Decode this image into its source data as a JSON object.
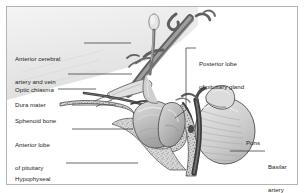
{
  "figure": {
    "border_color": "#b3b3b3",
    "background": "#ffffff",
    "text_color": "#231f20"
  },
  "labels": {
    "anterior_cerebral": {
      "line1": "Anterior cerebral",
      "line2": "artery and vein",
      "x": 15,
      "y": 40
    },
    "optic_chiasma": {
      "line1": "Optic chiasma",
      "x": 15,
      "y": 71
    },
    "dura_mater": {
      "line1": "Dura mater",
      "x": 15,
      "y": 86
    },
    "sphenoid_bone": {
      "line1": "Sphenoid bone",
      "x": 15,
      "y": 102
    },
    "anterior_lobe": {
      "line1": "Anterior lobe",
      "line2": "of pituitary",
      "x": 15,
      "y": 126
    },
    "hypophyseal_fossa": {
      "line1": "Hypophyseal",
      "line2": "fossa",
      "x": 15,
      "y": 160
    },
    "posterior_lobe": {
      "line1": "Posterior lobe",
      "line2": "of pituitary gland",
      "x": 199,
      "y": 45
    },
    "pons": {
      "line1": "Pons",
      "x": 246,
      "y": 124
    },
    "basilar_artery": {
      "line1": "Basilar",
      "line2": "artery",
      "x": 268,
      "y": 148
    }
  },
  "colors": {
    "outline": "#3a3a3a",
    "vessel_dark": "#6f6f6f",
    "vessel_mid": "#8e8e8e",
    "bone_stipple": "#8a8a8a",
    "bone_fill": "#cfcfcf",
    "gland_fill": "#b9b9b9",
    "gland_light": "#d6d6d6",
    "pons_fill": "#c8c8c8",
    "dura_band": "#4a4a4a",
    "leader_line": "#3a3a3a",
    "brain_fill": "#ededed"
  },
  "structures": [
    "anterior cerebral artery and vein",
    "optic chiasma",
    "dura mater",
    "sphenoid bone",
    "anterior lobe of pituitary",
    "hypophyseal fossa",
    "posterior lobe of pituitary gland",
    "infundibulum",
    "pons",
    "basilar artery"
  ]
}
